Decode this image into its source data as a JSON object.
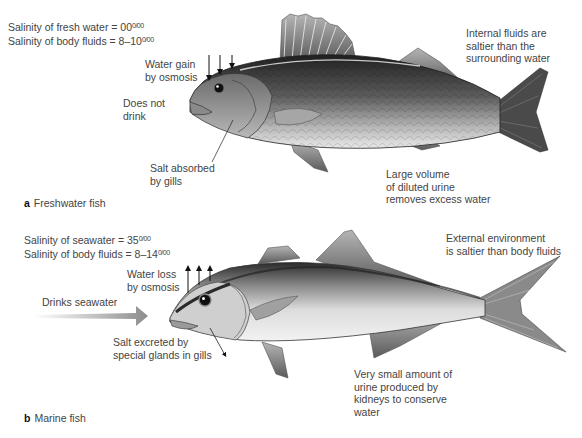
{
  "panel_a": {
    "caption_letter": "a",
    "caption_text": "Freshwater fish",
    "salinity_environment": "Salinity of fresh water = 00",
    "salinity_body": "Salinity of body fluids = 8–10",
    "permil_symbol": "0/00",
    "labels": {
      "water_gain": [
        "Water gain",
        "by osmosis"
      ],
      "does_not_drink": [
        "Does not",
        "drink"
      ],
      "salt_absorbed": [
        "Salt absorbed",
        "by gills"
      ],
      "internal_fluids": [
        "Internal fluids are",
        "saltier than the",
        "surrounding water"
      ],
      "urine": [
        "Large volume",
        "of diluted urine",
        "removes excess water"
      ]
    }
  },
  "panel_b": {
    "caption_letter": "b",
    "caption_text": "Marine fish",
    "salinity_environment": "Salinity of seawater = 35",
    "salinity_body": "Salinity of body fluids = 8–14",
    "permil_symbol": "0/00",
    "labels": {
      "water_loss": [
        "Water loss",
        "by osmosis"
      ],
      "drinks": [
        "Drinks seawater"
      ],
      "salt_excreted": [
        "Salt excreted by",
        "special glands in gills"
      ],
      "external_env": [
        "External environment",
        "is saltier than body fluids"
      ],
      "urine": [
        "Very small amount of",
        "urine produced by",
        "kidneys to conserve",
        "water"
      ]
    }
  },
  "colors": {
    "text": "#444444",
    "fish_dark": "#2e2e2e",
    "fish_light": "#e6e6e6",
    "drink_arrow": "#9a9a9a"
  }
}
